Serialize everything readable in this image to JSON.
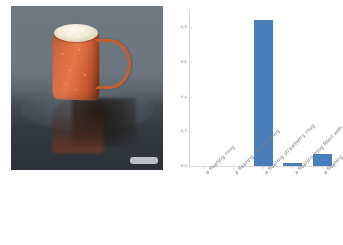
{
  "photo": {
    "alt_description": "floating orange ceramic mug with foam topping reflected on a dark glossy table",
    "watermark": ""
  },
  "chart_data": {
    "type": "bar",
    "title": "",
    "xlabel": "",
    "ylabel": "",
    "categories": [
      "a floating mug",
      "a floating ceramic mug",
      "a floating strawberry mug",
      "a floating mug filled with strawberries",
      "a floating strawberry mug on a table"
    ],
    "values": [
      0.0,
      0.0,
      0.84,
      0.02,
      0.07
    ],
    "ylim": [
      0.0,
      0.9
    ],
    "yticks": [
      0.0,
      0.2,
      0.4,
      0.6,
      0.8
    ],
    "ytick_labels": [
      "0.0",
      "0.2",
      "0.4",
      "0.6",
      "0.8"
    ],
    "grid": false,
    "legend": null,
    "bar_color": "#4a7ebb",
    "axis_color": "#d6d6d6",
    "tick_label_color": "#7d7d7d"
  }
}
